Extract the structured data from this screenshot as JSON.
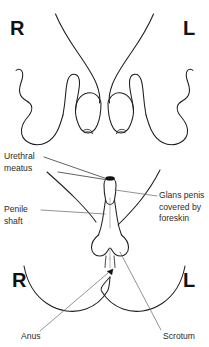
{
  "figure": {
    "type": "anatomical-line-drawing",
    "panels": [
      {
        "name": "upper-panel",
        "description": "Mirrored limb outlines with right and left orientation markers"
      },
      {
        "name": "lower-panel",
        "description": "External genitalia and perineum with labeled structures"
      }
    ]
  },
  "orientation_markers": {
    "upper_right": "R",
    "upper_left": "L",
    "lower_right": "R",
    "lower_left": "L"
  },
  "labels": {
    "urethral_meatus": "Urethral\nmeatus",
    "penile_shaft": "Penile\nshaft",
    "glans_penis": "Glans penis\ncovered by\nforeskin",
    "anus": "Anus",
    "scrotum": "Scrotum"
  },
  "colors": {
    "background": "#ffffff",
    "outline": "#1d1d1d",
    "leader": "#6f6f6f",
    "text": "#2b2b2b",
    "marker": "#111111"
  }
}
